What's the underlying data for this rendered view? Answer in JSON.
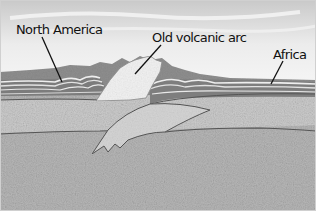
{
  "diagram": {
    "title": "",
    "style": "grayscale geological cross-section illustration",
    "labels": [
      {
        "id": "north-america",
        "text": "North America"
      },
      {
        "id": "old-volcanic-arc",
        "text": "Old volcanic arc"
      },
      {
        "id": "africa",
        "text": "Africa"
      }
    ],
    "regions": [
      {
        "name": "sky"
      },
      {
        "name": "mountain-range"
      },
      {
        "name": "north-america-folded-strata"
      },
      {
        "name": "old-volcanic-arc-block"
      },
      {
        "name": "africa-plate-strata"
      },
      {
        "name": "upper-crust"
      },
      {
        "name": "subducting-slab"
      },
      {
        "name": "mantle"
      }
    ],
    "colors": {
      "sky_top": "#cfcfcf",
      "sky_bottom": "#f0f0f0",
      "mountains": "#8c8c8c",
      "strata_dark": "#7a7a7a",
      "strata_light": "#e8e8e8",
      "arc_block": "#f2f2f2",
      "crust": "#c8c8c8",
      "mantle": "#b4b4b4",
      "boundary_line": "#555555",
      "label_line": "#111111"
    }
  }
}
